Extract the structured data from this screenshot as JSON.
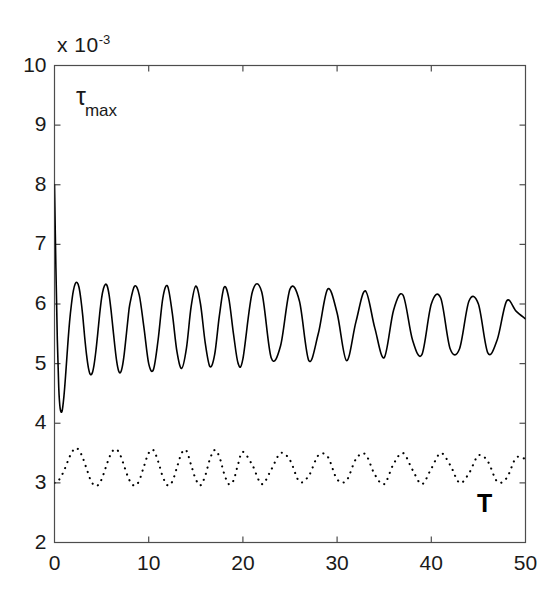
{
  "chart_data": {
    "type": "line",
    "title": "",
    "subtitle": "",
    "xlabel": "T",
    "ylabel": "τ",
    "ylabel_subscript": "max",
    "y_exponent_label": "x 10",
    "y_exponent_power": "-3",
    "xlim": [
      0,
      50
    ],
    "ylim": [
      2,
      10
    ],
    "xticks": [
      0,
      10,
      20,
      30,
      40,
      50
    ],
    "yticks": [
      2,
      3,
      4,
      5,
      6,
      7,
      8,
      9,
      10
    ],
    "xtick_labels": [
      "0",
      "10",
      "20",
      "30",
      "40",
      "50"
    ],
    "ytick_labels": [
      "2",
      "3",
      "4",
      "5",
      "6",
      "7",
      "8",
      "9",
      "10"
    ],
    "grid": false,
    "legend": "none",
    "box": true,
    "tick_direction": "in",
    "annotations": [
      {
        "text": "τmax",
        "position": "upper-left-inside"
      },
      {
        "text": "T",
        "position": "lower-right-inside"
      }
    ],
    "series": [
      {
        "name": "solid",
        "style": "solid",
        "color": "#000000",
        "linewidth": 1.6,
        "description": "Sharp initial drop from ~8 to ~4.2 then sustained oscillation about ~5.6 with slowly decaying amplitude, period ~4",
        "x": [
          0,
          0.15,
          0.3,
          0.45,
          0.6,
          0.8,
          1,
          1.2,
          1.4,
          1.6,
          1.8,
          2,
          2.2,
          2.4,
          2.6,
          2.8,
          3,
          3.2,
          3.4,
          3.6,
          3.8,
          4,
          4.2,
          4.4,
          4.6,
          4.8,
          5,
          5.2,
          5.4,
          5.6,
          5.8,
          6,
          6.2,
          6.4,
          6.6,
          6.8,
          7,
          7.2,
          7.4,
          7.6,
          7.8,
          8,
          8.5,
          9,
          9.5,
          10,
          10.5,
          11,
          11.5,
          12,
          12.5,
          13,
          13.5,
          14,
          14.5,
          15,
          15.5,
          16,
          16.5,
          17,
          17.5,
          18,
          18.5,
          19,
          19.5,
          20,
          21,
          22,
          23,
          24,
          25,
          26,
          27,
          28,
          29,
          30,
          31,
          32,
          33,
          34,
          35,
          36,
          37,
          38,
          39,
          40,
          41,
          42,
          43,
          44,
          45,
          46,
          47,
          48,
          49,
          50
        ],
        "y": [
          8.0,
          6.6,
          5.4,
          4.6,
          4.25,
          4.2,
          4.45,
          4.85,
          5.3,
          5.7,
          6.0,
          6.22,
          6.34,
          6.36,
          6.28,
          6.08,
          5.8,
          5.45,
          5.15,
          4.93,
          4.82,
          4.84,
          4.98,
          5.22,
          5.52,
          5.84,
          6.1,
          6.26,
          6.33,
          6.3,
          6.15,
          5.9,
          5.6,
          5.3,
          5.04,
          4.88,
          4.85,
          4.95,
          5.16,
          5.45,
          5.75,
          6.0,
          6.3,
          6.15,
          5.6,
          5.0,
          4.9,
          5.4,
          6.1,
          6.3,
          5.85,
          5.2,
          4.92,
          5.25,
          5.95,
          6.3,
          6.0,
          5.35,
          4.95,
          5.15,
          5.8,
          6.28,
          6.1,
          5.5,
          5.0,
          5.08,
          6.2,
          6.2,
          5.1,
          5.3,
          6.25,
          6.05,
          5.05,
          5.5,
          6.25,
          5.85,
          5.05,
          5.7,
          6.22,
          5.6,
          5.1,
          5.9,
          6.15,
          5.4,
          5.15,
          6.0,
          6.1,
          5.25,
          5.25,
          6.05,
          6.0,
          5.18,
          5.4,
          6.05,
          5.88,
          5.75
        ]
      },
      {
        "name": "dotted",
        "style": "dotted",
        "color": "#000000",
        "linewidth": 1.4,
        "description": "Low-amplitude oscillation about ~3.25, starting at 3.0, peaks ~3.58, troughs ~2.95, period ~4",
        "x": [
          0,
          0.3,
          0.6,
          1,
          1.4,
          1.8,
          2.2,
          2.6,
          3,
          3.4,
          3.8,
          4.2,
          4.6,
          5,
          5.4,
          5.8,
          6.2,
          6.6,
          7,
          7.4,
          7.8,
          8.2,
          8.6,
          9,
          9.5,
          10,
          10.5,
          11,
          11.5,
          12,
          12.5,
          13,
          13.5,
          14,
          14.5,
          15,
          15.5,
          16,
          16.5,
          17,
          17.5,
          18,
          18.5,
          19,
          19.5,
          20,
          21,
          22,
          23,
          24,
          25,
          26,
          27,
          28,
          29,
          30,
          31,
          32,
          33,
          34,
          35,
          36,
          37,
          38,
          39,
          40,
          41,
          42,
          43,
          44,
          45,
          46,
          47,
          48,
          49,
          50
        ],
        "y": [
          3.0,
          3.02,
          3.08,
          3.2,
          3.36,
          3.5,
          3.58,
          3.55,
          3.42,
          3.24,
          3.06,
          2.96,
          2.96,
          3.06,
          3.24,
          3.42,
          3.54,
          3.56,
          3.46,
          3.28,
          3.1,
          2.98,
          2.96,
          3.04,
          3.28,
          3.5,
          3.55,
          3.36,
          3.1,
          2.96,
          3.02,
          3.26,
          3.5,
          3.54,
          3.3,
          3.06,
          2.96,
          3.12,
          3.4,
          3.55,
          3.44,
          3.16,
          2.98,
          3.04,
          3.32,
          3.52,
          3.3,
          2.98,
          3.22,
          3.5,
          3.38,
          3.02,
          3.12,
          3.46,
          3.44,
          3.06,
          3.04,
          3.4,
          3.48,
          3.14,
          2.98,
          3.32,
          3.5,
          3.22,
          2.98,
          3.24,
          3.5,
          3.3,
          3.0,
          3.16,
          3.46,
          3.36,
          3.02,
          3.08,
          3.42,
          3.4
        ]
      }
    ]
  },
  "axes": {
    "exponent_prefix": "x 10",
    "exponent_power": "-3"
  }
}
